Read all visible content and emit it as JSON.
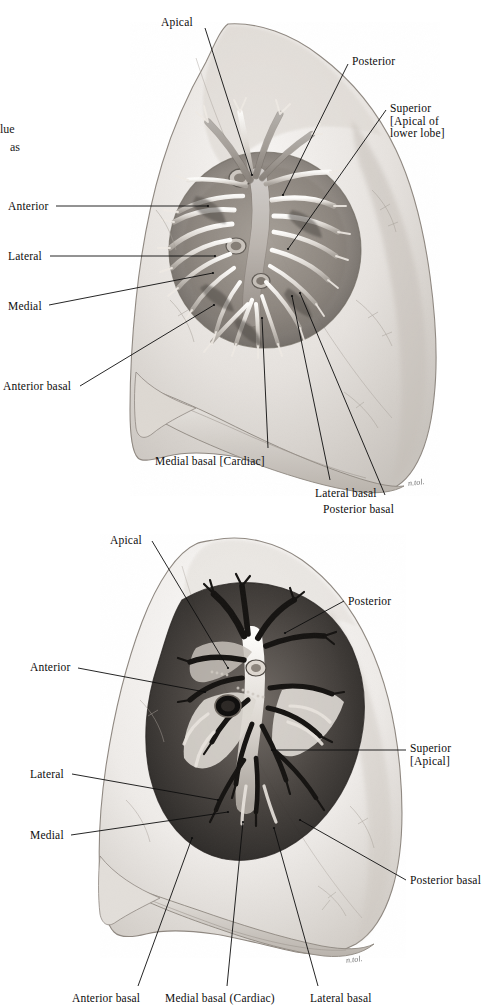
{
  "plate": {
    "title": "Bronchopulmonary segments of the lungs (dissected hilum)",
    "background_color": "#ffffff",
    "ink_color": "#0d0d0d",
    "figure_count": 2
  },
  "margin_fragments": [
    {
      "text": "lue",
      "x": 0,
      "y": 122
    },
    {
      "text": "as",
      "x": 10,
      "y": 140
    }
  ],
  "figures": [
    {
      "name": "upper-figure",
      "caption": "Right lung, costal/lateral view with hilum dissected",
      "view_box": {
        "x": 110,
        "y": 20,
        "width": 360,
        "height": 490
      },
      "signature": {
        "text": "n.tol.",
        "x": 408,
        "y": 478
      },
      "labels": [
        {
          "id": "apical",
          "text": "Apical",
          "x": 161,
          "y": 16,
          "align": "left",
          "leader": [
            [
              205,
              28
            ],
            [
              252,
              175
            ]
          ]
        },
        {
          "id": "posterior",
          "text": "Posterior",
          "x": 352,
          "y": 55,
          "align": "left",
          "leader": [
            [
              348,
              64
            ],
            [
              283,
              195
            ]
          ]
        },
        {
          "id": "superior",
          "text": "Superior\n[Apical of\nlower lobe]",
          "x": 390,
          "y": 102,
          "align": "left",
          "leader": [
            [
              386,
              110
            ],
            [
              288,
              249
            ]
          ]
        },
        {
          "id": "anterior",
          "text": "Anterior",
          "x": 8,
          "y": 200,
          "align": "left",
          "leader": [
            [
              56,
              206
            ],
            [
              208,
              206
            ]
          ]
        },
        {
          "id": "lateral",
          "text": "Lateral",
          "x": 8,
          "y": 250,
          "align": "left",
          "leader": [
            [
              50,
              256
            ],
            [
              215,
              256
            ]
          ]
        },
        {
          "id": "medial",
          "text": "Medial",
          "x": 8,
          "y": 300,
          "align": "left",
          "leader": [
            [
              49,
              305
            ],
            [
              213,
              273
            ]
          ]
        },
        {
          "id": "anterior-basal",
          "text": "Anterior basal",
          "x": 3,
          "y": 380,
          "align": "left",
          "leader": [
            [
              80,
              386
            ],
            [
              214,
              305
            ]
          ]
        },
        {
          "id": "medial-basal",
          "text": "Medial basal [Cardiac]",
          "x": 155,
          "y": 455,
          "align": "left",
          "leader": [
            [
              268,
              448
            ],
            [
              262,
              318
            ]
          ]
        },
        {
          "id": "lateral-basal",
          "text": "Lateral basal",
          "x": 315,
          "y": 487,
          "align": "left",
          "leader": [
            [
              330,
              480
            ],
            [
              292,
              296
            ]
          ]
        },
        {
          "id": "posterior-basal",
          "text": "Posterior basal",
          "x": 323,
          "y": 503,
          "align": "left",
          "leader": [
            [
              385,
              495
            ],
            [
              300,
              293
            ]
          ]
        }
      ]
    },
    {
      "name": "lower-figure",
      "caption": "Left lung, costal/lateral view with hilum dissected",
      "view_box": {
        "x": 60,
        "y": 528,
        "width": 380,
        "height": 470
      },
      "signature": {
        "text": "n.tol.",
        "x": 346,
        "y": 955
      },
      "labels": [
        {
          "id": "apical",
          "text": "Apical",
          "x": 110,
          "y": 534,
          "align": "left",
          "leader": [
            [
              152,
              541
            ],
            [
              228,
              668
            ]
          ]
        },
        {
          "id": "posterior",
          "text": "Posterior",
          "x": 348,
          "y": 595,
          "align": "left",
          "leader": [
            [
              344,
              601
            ],
            [
              285,
              633
            ]
          ]
        },
        {
          "id": "anterior",
          "text": "Anterior",
          "x": 30,
          "y": 661,
          "align": "left",
          "leader": [
            [
              78,
              668
            ],
            [
              205,
              692
            ]
          ]
        },
        {
          "id": "superior",
          "text": "Superior\n  [Apical]",
          "x": 410,
          "y": 742,
          "align": "left",
          "leader": [
            [
              406,
              750
            ],
            [
              272,
              750
            ]
          ]
        },
        {
          "id": "lateral",
          "text": "Lateral",
          "x": 30,
          "y": 768,
          "align": "left",
          "leader": [
            [
              72,
              774
            ],
            [
              218,
              800
            ]
          ]
        },
        {
          "id": "medial",
          "text": "Medial",
          "x": 30,
          "y": 829,
          "align": "left",
          "leader": [
            [
              71,
              835
            ],
            [
              228,
              812
            ]
          ]
        },
        {
          "id": "posterior-basal",
          "text": "Posterior basal",
          "x": 410,
          "y": 874,
          "align": "left",
          "leader": [
            [
              406,
              880
            ],
            [
              300,
              820
            ]
          ]
        },
        {
          "id": "anterior-basal",
          "text": "Anterior basal",
          "x": 72,
          "y": 992,
          "align": "left",
          "leader": [
            [
              138,
              986
            ],
            [
              192,
              838
            ]
          ]
        },
        {
          "id": "medial-basal",
          "text": "Medial basal (Cardiac)",
          "x": 165,
          "y": 992,
          "align": "left",
          "leader": [
            [
              227,
              986
            ],
            [
              243,
              822
            ]
          ]
        },
        {
          "id": "lateral-basal",
          "text": "Lateral basal",
          "x": 310,
          "y": 992,
          "align": "left",
          "leader": [
            [
              318,
              986
            ],
            [
              274,
              828
            ]
          ]
        }
      ]
    }
  ]
}
